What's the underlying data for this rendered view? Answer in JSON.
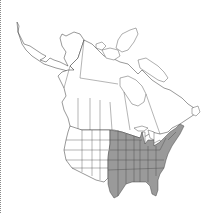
{
  "map": {
    "title": "North America distribution map",
    "region": "North America",
    "legend": {
      "present_color": "#9a9a9a",
      "absent_color": "#ffffff",
      "outline_color": "#333333"
    },
    "present_regions": [
      "Texas",
      "Oklahoma",
      "Kansas",
      "Nebraska",
      "South Dakota",
      "North Dakota",
      "Minnesota",
      "Iowa",
      "Missouri",
      "Arkansas",
      "Louisiana",
      "Wisconsin",
      "Illinois",
      "Michigan",
      "Indiana",
      "Ohio",
      "Kentucky",
      "Tennessee",
      "Mississippi",
      "Alabama",
      "Georgia",
      "Florida",
      "South Carolina",
      "North Carolina",
      "Virginia",
      "West Virginia",
      "Maryland",
      "Delaware",
      "Pennsylvania",
      "New Jersey",
      "New York",
      "Connecticut",
      "Rhode Island",
      "Massachusetts",
      "Vermont",
      "New Hampshire",
      "Maine"
    ]
  }
}
